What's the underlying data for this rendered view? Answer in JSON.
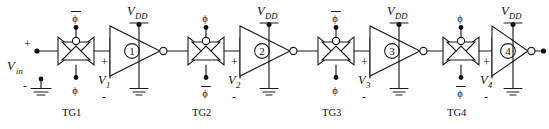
{
  "figure": {
    "type": "schematic",
    "width": 549,
    "height": 129,
    "background": "#ffffff",
    "ink_color": "#1a1a1a"
  },
  "input": {
    "label": "V",
    "subscript": "in",
    "plus_sign": "+",
    "minus_sign": "-",
    "ground_name": "ground-symbol"
  },
  "supply": {
    "label": "V",
    "subscript": "DD"
  },
  "clock": {
    "phi": "ϕ",
    "phi_bar": "ϕ",
    "overbar": "¯"
  },
  "stages": [
    {
      "gate_name": "TG1",
      "top_clock": "phi_bar",
      "bottom_clock": "phi",
      "inverter_number": "1",
      "node_label": "V",
      "node_subscript": "1",
      "plus_sign": "+",
      "minus_sign": "-",
      "supply_label": "V",
      "supply_subscript": "DD"
    },
    {
      "gate_name": "TG2",
      "top_clock": "phi",
      "bottom_clock": "phi_bar",
      "inverter_number": "2",
      "node_label": "V",
      "node_subscript": "2",
      "plus_sign": "+",
      "minus_sign": "-",
      "supply_label": "V",
      "supply_subscript": "DD"
    },
    {
      "gate_name": "TG3",
      "top_clock": "phi_bar",
      "bottom_clock": "phi",
      "inverter_number": "3",
      "node_label": "V",
      "node_subscript": "3",
      "plus_sign": "+",
      "minus_sign": "-",
      "supply_label": "V",
      "supply_subscript": "DD"
    },
    {
      "gate_name": "TG4",
      "top_clock": "phi",
      "bottom_clock": "phi_bar",
      "inverter_number": "4",
      "node_label": "V",
      "node_subscript": "4",
      "plus_sign": "+",
      "minus_sign": "-",
      "supply_label": "V",
      "supply_subscript": "DD"
    }
  ]
}
